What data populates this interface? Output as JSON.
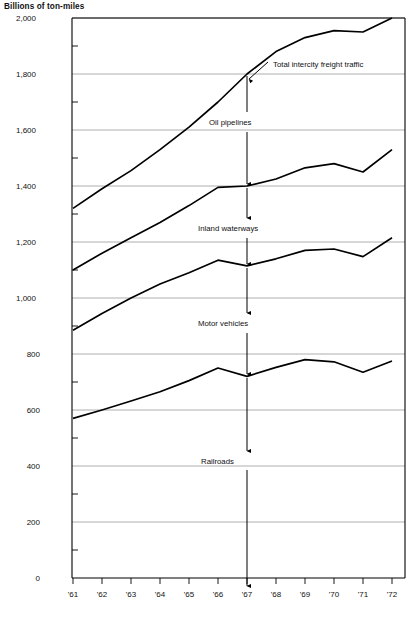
{
  "chart_data": {
    "type": "line",
    "title": "Billions of ton-miles",
    "subtitle": "",
    "xlabel": "",
    "ylabel": "Billions of ton-miles",
    "x": [
      "'61",
      "'62",
      "'63",
      "'64",
      "'65",
      "'66",
      "'67",
      "'68",
      "'69",
      "'70",
      "'71",
      "'72"
    ],
    "xtick_labels": [
      "'61",
      "'62",
      "'63",
      "'64",
      "'65",
      "'66",
      "'67",
      "'68",
      "'69",
      "'70",
      "'71",
      "'72"
    ],
    "ytick_labels": [
      "0",
      "200",
      "400",
      "600",
      "800",
      "1,000",
      "1,200",
      "1,400",
      "1,600",
      "1,800",
      "2,000"
    ],
    "ytick_values": [
      0,
      200,
      400,
      600,
      800,
      1000,
      1200,
      1400,
      1600,
      1800,
      2000
    ],
    "yminor_values": [
      100,
      300,
      500,
      700,
      900,
      1100,
      1300,
      1500,
      1700,
      1900
    ],
    "ylim": [
      0,
      2000
    ],
    "grid": true,
    "grid_axis": "y",
    "legend": "inline-annotations",
    "legend_position": "inline",
    "series": [
      {
        "name": "Total intercity freight traffic",
        "values": [
          1320,
          1390,
          1455,
          1530,
          1610,
          1700,
          1800,
          1880,
          1930,
          1955,
          1950,
          2000
        ]
      },
      {
        "name": "Oil pipelines",
        "values": [
          1100,
          1160,
          1215,
          1270,
          1330,
          1395,
          1400,
          1425,
          1465,
          1480,
          1450,
          1530
        ]
      },
      {
        "name": "Inland waterways",
        "values": [
          885,
          945,
          1000,
          1050,
          1090,
          1135,
          1115,
          1140,
          1170,
          1175,
          1148,
          1215
        ]
      },
      {
        "name": "Motor vehicles",
        "values": [
          570,
          600,
          632,
          665,
          705,
          750,
          720,
          752,
          780,
          772,
          735,
          775
        ]
      }
    ],
    "annotations": [
      {
        "label": "Total intercity freight traffic",
        "points_to": "top-curve",
        "at_x": "'68"
      },
      {
        "label": "Oil pipelines",
        "band_between": [
          "Total intercity freight traffic",
          "Oil pipelines"
        ],
        "at_x": "'67"
      },
      {
        "label": "Inland waterways",
        "band_between": [
          "Oil pipelines",
          "Inland waterways"
        ],
        "at_x": "'67"
      },
      {
        "label": "Motor vehicles",
        "band_between": [
          "Inland waterways",
          "Motor vehicles"
        ],
        "at_x": "'67"
      },
      {
        "label": "Railroads",
        "band_between": [
          "Motor vehicles",
          "zero-baseline"
        ],
        "at_x": "'67"
      }
    ],
    "colors": {
      "line": "#000000",
      "grid": "#9a9a9a",
      "axis": "#000000",
      "background": "#ffffff"
    }
  },
  "labels": {
    "axis_title": "Billions of ton-miles",
    "series": {
      "total": "Total intercity freight traffic",
      "oil": "Oil pipelines",
      "inland": "Inland waterways",
      "motor": "Motor vehicles",
      "rail": "Railroads"
    },
    "y": {
      "t0": "0",
      "t1": "200",
      "t2": "400",
      "t3": "600",
      "t4": "800",
      "t5": "1,000",
      "t6": "1,200",
      "t7": "1,400",
      "t8": "1,600",
      "t9": "1,800",
      "t10": "2,000"
    },
    "x": {
      "t0": "'61",
      "t1": "'62",
      "t2": "'63",
      "t3": "'64",
      "t4": "'65",
      "t5": "'66",
      "t6": "'67",
      "t7": "'68",
      "t8": "'69",
      "t9": "'70",
      "t10": "'71",
      "t11": "'72"
    }
  }
}
